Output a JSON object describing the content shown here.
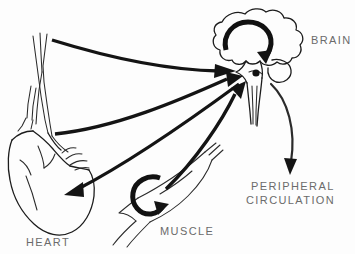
{
  "figure": {
    "title_text": "",
    "background_color": "#fdfdfd",
    "ink_color": "#141414",
    "label_color": "#6b6b6b",
    "width": 355,
    "height": 254
  },
  "labels": {
    "brain": "BRAIN",
    "heart": "HEART",
    "muscle": "MUSCLE",
    "peripheral_line1": "PERIPHERAL",
    "peripheral_line2": "CIRCULATION"
  },
  "organs": [
    {
      "id": "brain",
      "name": "brain",
      "label": "BRAIN",
      "label_x": 311,
      "label_y": 34,
      "description": "cloud-shaped cerebrum with brainstem and spinal cord below"
    },
    {
      "id": "heart",
      "name": "heart",
      "label": "HEART",
      "label_x": 26,
      "label_y": 236,
      "description": "heart with great vessels, aorta and vena cava rising upward"
    },
    {
      "id": "muscle",
      "name": "muscle",
      "label": "MUSCLE",
      "label_x": 160,
      "label_y": 225,
      "description": "spindle-shaped skeletal muscle belly with tendons"
    },
    {
      "id": "peripheral-circulation",
      "name": "peripheral-circulation",
      "label": "PERIPHERAL CIRCULATION",
      "label_x": 246,
      "label_y": 180,
      "description": "text-only node receiving efferent outflow from brain"
    }
  ],
  "connections": [
    {
      "id": "vessels-to-brain",
      "from": "great-vessels",
      "to": "brainstem",
      "type": "afferent",
      "style": "thick-curved-arrow"
    },
    {
      "id": "heart-to-brain",
      "from": "heart",
      "to": "brainstem",
      "type": "afferent",
      "style": "thick-curved-arrow"
    },
    {
      "id": "muscle-to-brain",
      "from": "muscle",
      "to": "brainstem",
      "type": "afferent",
      "style": "thick-straight-arrow"
    },
    {
      "id": "brain-to-heart",
      "from": "brainstem",
      "to": "heart",
      "type": "efferent",
      "style": "thick-straight-arrow"
    },
    {
      "id": "brain-to-peripheral-circulation",
      "from": "brainstem",
      "to": "peripheral-circulation",
      "type": "efferent",
      "style": "thin-curved-arrow"
    },
    {
      "id": "brain-internal-loop",
      "from": "brain",
      "to": "brain",
      "type": "loop",
      "style": "thick-circular-arrow"
    },
    {
      "id": "muscle-internal-loop",
      "from": "muscle",
      "to": "muscle",
      "type": "loop",
      "style": "thick-circular-arrow"
    }
  ]
}
